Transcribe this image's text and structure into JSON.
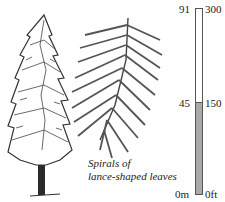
{
  "caption": {
    "line1": "Spirals of",
    "line2": "lance-shaped leaves"
  },
  "scale": {
    "left_labels": {
      "top": "91",
      "mid": "45",
      "bottom": "0m"
    },
    "right_labels": {
      "top": "300",
      "mid": "150",
      "bottom": "0ft"
    },
    "fill_color": "#a9a9a9",
    "fill_fraction": 0.5
  },
  "illustrations": {
    "tree": "conifer-tree-icon",
    "branch": "conifer-branch-icon"
  }
}
